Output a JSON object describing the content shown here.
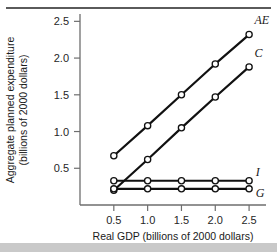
{
  "chart_data": {
    "type": "line",
    "title": "",
    "xlabel": "Real GDP (billions of 2000 dollars)",
    "ylabel": "Aggregate planned expenditure (billions of 2000 dollars)",
    "ylabel_line1": "Aggregate planned expenditure",
    "ylabel_line2": "(billions of 2000 dollars)",
    "x": [
      0.5,
      1.0,
      1.5,
      2.0,
      2.5
    ],
    "xlim": [
      0.0,
      2.75
    ],
    "ylim": [
      0.0,
      2.6
    ],
    "xticks": [
      "0.5",
      "1.0",
      "1.5",
      "2.0",
      "2.5"
    ],
    "xtick_values": [
      0.5,
      1.0,
      1.5,
      2.0,
      2.5
    ],
    "yticks": [
      "0.5",
      "1.0",
      "1.5",
      "2.0",
      "2.5"
    ],
    "ytick_values": [
      0.5,
      1.0,
      1.5,
      2.0,
      2.5
    ],
    "grid": false,
    "legend_position": "right-of-line-ends",
    "marker": "open-circle",
    "series": [
      {
        "name": "AE",
        "label": "AE",
        "values": [
          0.67,
          1.08,
          1.5,
          1.92,
          2.32
        ],
        "label_x": 2.58,
        "label_y": 2.46
      },
      {
        "name": "C",
        "label": "C",
        "values": [
          0.2,
          0.62,
          1.05,
          1.47,
          1.88
        ],
        "label_x": 2.58,
        "label_y": 2.02
      },
      {
        "name": "I",
        "label": "I",
        "values": [
          0.33,
          0.33,
          0.33,
          0.33,
          0.33
        ],
        "label_x": 2.6,
        "label_y": 0.4
      },
      {
        "name": "G",
        "label": "G",
        "values": [
          0.22,
          0.22,
          0.22,
          0.22,
          0.22
        ],
        "label_x": 2.6,
        "label_y": 0.11
      }
    ]
  },
  "colors": {
    "line": "#111111",
    "axis": "#6e6e6e",
    "text": "#1a1a1a",
    "background": "#ffffff",
    "top_rule": "#5a5a5a",
    "bottom_bar": "#c9c9c9"
  }
}
